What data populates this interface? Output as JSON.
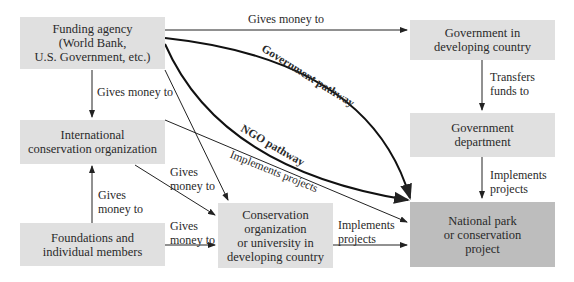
{
  "boxes": {
    "funding": "Funding agency\n(World Bank,\nU.S. Government, etc.)",
    "gov": "Government in\ndeveloping country",
    "intl": "International\nconservation organization",
    "govdept": "Government\ndepartment",
    "found": "Foundations and\nindividual members",
    "cons": "Conservation\norganization\nor university in\ndeveloping country",
    "park": "National park\nor conservation\nproject"
  },
  "labels": {
    "top": "Gives money to",
    "fund_intl": "Gives money to",
    "transfers": "Transfers\nfunds to",
    "intl_cons": "Gives\nmoney to",
    "found_intl": "Gives\nmoney to",
    "found_cons": "Gives\nmoney to",
    "cons_park": "Implements\nprojects",
    "govdept_park": "Implements\nprojects",
    "intl_park": "Implements projects",
    "gov_path": "Government pathway",
    "ngo_path": "NGO pathway"
  }
}
